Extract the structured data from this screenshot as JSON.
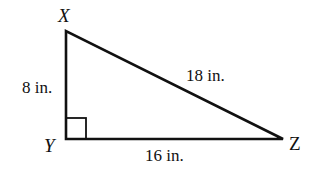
{
  "diagram": {
    "type": "right-triangle",
    "stroke_color": "#111111",
    "vertices": {
      "X": {
        "label": "X",
        "x": 66,
        "y": 31
      },
      "Y": {
        "label": "Y",
        "x": 66,
        "y": 139
      },
      "Z": {
        "label": "Z",
        "x": 283,
        "y": 139
      }
    },
    "right_angle_at": "Y",
    "sides": {
      "XY": {
        "label": "8 in."
      },
      "YZ": {
        "label": "16 in."
      },
      "XZ": {
        "label": "18 in."
      }
    }
  }
}
